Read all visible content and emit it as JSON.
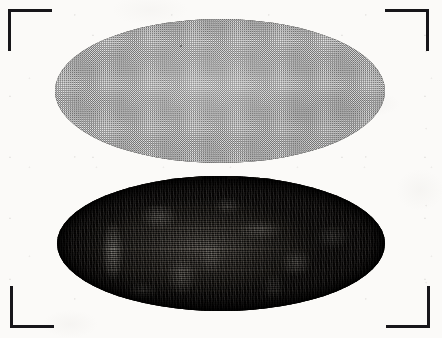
{
  "plate": {
    "title": "Scanned halftone plate with two ovals",
    "background_color": "#fbfaf8",
    "width": 442,
    "height": 338,
    "medium": "scanned printed page",
    "caption": "",
    "labels": []
  },
  "crop_marks": {
    "stroke_color": "#17161a",
    "stroke_width": 3,
    "arm_length": 44,
    "items": [
      {
        "name": "top-left",
        "x": 8,
        "y": 9
      },
      {
        "name": "top-right",
        "x": 385,
        "y": 9
      },
      {
        "name": "bottom-left",
        "x": 10,
        "y": 286
      },
      {
        "name": "bottom-right",
        "x": 386,
        "y": 286
      }
    ]
  },
  "figures": [
    {
      "id": "oval-upper",
      "shape": "ellipse",
      "position": "upper",
      "x": 55,
      "y": 19,
      "width": 330,
      "height": 144,
      "fill": "halftone dot screen, uniform mid gray",
      "fill_color": "#b9b9b9",
      "outline_color": "#3b3a38",
      "tone": "flat 50% screen",
      "label": ""
    },
    {
      "id": "oval-lower",
      "shape": "ellipse",
      "position": "lower",
      "x": 57,
      "y": 176,
      "width": 328,
      "height": 135,
      "fill": "dark mottled horizontal line screen with speckled highlights",
      "fill_color": "#15130f",
      "outline_color": "#0b0a08",
      "tone": "dark, rim heaviest, mottled interior",
      "label": ""
    }
  ]
}
